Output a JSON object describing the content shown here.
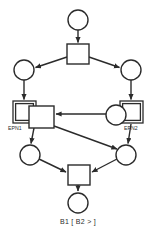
{
  "figure": {
    "kind": "petri-net-diagram",
    "caption": "B1 [ B2 > ]",
    "stroke_color": "#2b2b2b",
    "fill_color": "#ffffff",
    "label_color": "#2b2b2b",
    "labels": {
      "left_subnet": "EPN1",
      "right_subnet": "EPN2"
    },
    "nodes": {
      "p_start": {
        "type": "place",
        "label": "",
        "cx": 78,
        "cy": 20,
        "r": 10
      },
      "t_fork": {
        "type": "transition",
        "label": "",
        "x": 67,
        "y": 44,
        "w": 22,
        "h": 20
      },
      "p_left": {
        "type": "place",
        "label": "",
        "cx": 24,
        "cy": 70,
        "r": 10
      },
      "p_right": {
        "type": "place",
        "label": "",
        "cx": 131,
        "cy": 70,
        "r": 10
      },
      "sub_left": {
        "type": "subnet",
        "label": "EPN1",
        "x": 13,
        "y": 101,
        "w": 23,
        "h": 22
      },
      "t_left": {
        "type": "transition",
        "label": "",
        "x": 29,
        "y": 106,
        "w": 25,
        "h": 22
      },
      "sub_right": {
        "type": "subnet",
        "label": "EPN2",
        "x": 120,
        "y": 101,
        "w": 23,
        "h": 22
      },
      "p_mid_right": {
        "type": "place",
        "label": "",
        "cx": 116,
        "cy": 115,
        "r": 10
      },
      "p_low_left": {
        "type": "place",
        "label": "",
        "cx": 30,
        "cy": 155,
        "r": 10
      },
      "p_low_right": {
        "type": "place",
        "label": "",
        "cx": 126,
        "cy": 155,
        "r": 10
      },
      "t_join": {
        "type": "transition",
        "label": "",
        "x": 68,
        "y": 165,
        "w": 22,
        "h": 20
      },
      "p_end": {
        "type": "place",
        "label": "",
        "cx": 78,
        "cy": 203,
        "r": 10
      }
    },
    "arcs": [
      {
        "from": "p_start",
        "to": "t_fork"
      },
      {
        "from": "t_fork",
        "to": "p_left"
      },
      {
        "from": "t_fork",
        "to": "p_right"
      },
      {
        "from": "p_left",
        "to": "sub_left"
      },
      {
        "from": "p_right",
        "to": "sub_right"
      },
      {
        "from": "p_mid_right",
        "to": "t_left"
      },
      {
        "from": "t_left",
        "to": "p_low_left"
      },
      {
        "from": "t_left",
        "to": "p_low_right"
      },
      {
        "from": "sub_right",
        "to": "p_low_right"
      },
      {
        "from": "p_low_left",
        "to": "t_join"
      },
      {
        "from": "p_low_right",
        "to": "t_join"
      },
      {
        "from": "t_join",
        "to": "p_end"
      }
    ]
  }
}
